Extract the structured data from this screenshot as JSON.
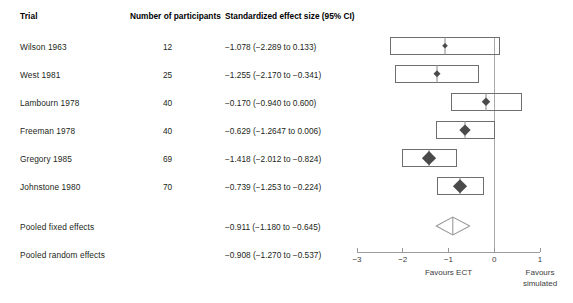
{
  "table": {
    "headers": {
      "trial": "Trial",
      "participants": "Number of participants",
      "effect": "Standardized effect size (95% CI)"
    },
    "rows": [
      {
        "trial": "Wilson 1963",
        "n": "12",
        "effect": "−1.078 (−2.289 to 0.133)"
      },
      {
        "trial": "West 1981",
        "n": "25",
        "effect": "−1.255 (−2.170 to −0.341)"
      },
      {
        "trial": "Lambourn 1978",
        "n": "40",
        "effect": "−0.170 (−0.940 to 0.600)"
      },
      {
        "trial": "Freeman 1978",
        "n": "40",
        "effect": "−0.629 (−1.2647 to 0.006)"
      },
      {
        "trial": "Gregory 1985",
        "n": "69",
        "effect": "−1.418 (−2.012 to −0.824)"
      },
      {
        "trial": "Johnstone 1980",
        "n": "70",
        "effect": "−0.739 (−1.253 to −0.224)"
      }
    ],
    "pooled": [
      {
        "trial": "Pooled fixed effects",
        "n": "",
        "effect": "−0.911 (−1.180 to −0.645)"
      },
      {
        "trial": "Pooled random effects",
        "n": "",
        "effect": "−0.908 (−1.270 to −0.537)"
      }
    ]
  },
  "axis": {
    "ticks": [
      "−3",
      "−2",
      "−1",
      "0",
      "1"
    ],
    "tick_values": [
      -3,
      -2,
      -1,
      0,
      1
    ],
    "min": -3,
    "max": 1,
    "null_value": 0,
    "favours_left": "Favours ECT",
    "favours_right_line1": "Favours",
    "favours_right_line2": "simulated"
  },
  "colors": {
    "box_stroke": "#6e6e6e",
    "marker": "#4a4a4a",
    "axis": "#9a9a9a",
    "zero_line": "#a9a9a9",
    "text": "#231f20"
  },
  "chart_data": {
    "type": "forest",
    "title": "Standardized effect size (95% CI)",
    "xlabel": "Standardized effect size",
    "xlim": [
      -3,
      1
    ],
    "xticks": [
      -3,
      -2,
      -1,
      0,
      1
    ],
    "null_line": 0,
    "grid": false,
    "legend": "none",
    "favours_left_label": "Favours ECT",
    "favours_right_label": "Favours simulated",
    "studies": [
      {
        "name": "Wilson 1963",
        "n": 12,
        "estimate": -1.078,
        "ci_low": -2.289,
        "ci_high": 0.133,
        "weight": 0.12
      },
      {
        "name": "West 1981",
        "n": 25,
        "estimate": -1.255,
        "ci_low": -2.17,
        "ci_high": -0.341,
        "weight": 0.22
      },
      {
        "name": "Lambourn 1978",
        "n": 40,
        "estimate": -0.17,
        "ci_low": -0.94,
        "ci_high": 0.6,
        "weight": 0.3
      },
      {
        "name": "Freeman 1978",
        "n": 40,
        "estimate": -0.629,
        "ci_low": -1.2647,
        "ci_high": 0.006,
        "weight": 0.44
      },
      {
        "name": "Gregory 1985",
        "n": 69,
        "estimate": -1.418,
        "ci_low": -2.012,
        "ci_high": -0.824,
        "weight": 0.62
      },
      {
        "name": "Johnstone 1980",
        "n": 70,
        "estimate": -0.739,
        "ci_low": -1.253,
        "ci_high": -0.224,
        "weight": 0.6
      }
    ],
    "summaries": [
      {
        "name": "Pooled fixed effects",
        "estimate": -0.911,
        "ci_low": -1.18,
        "ci_high": -0.645,
        "drawn": false
      },
      {
        "name": "Pooled random effects",
        "estimate": -0.908,
        "ci_low": -1.27,
        "ci_high": -0.537,
        "drawn": true
      }
    ]
  }
}
